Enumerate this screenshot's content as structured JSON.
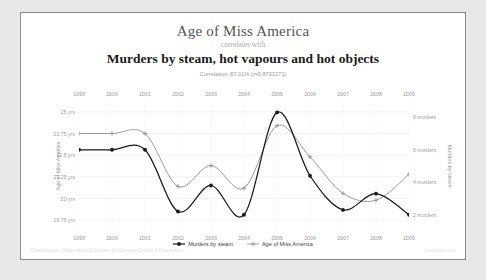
{
  "titles": {
    "main": "Age of Miss America",
    "connector": "correlates with",
    "subtitle": "Murders by steam, hot vapours and hot objects",
    "correlation": "Correlation: 87.01% (r=0.8701271)"
  },
  "footer": {
    "source": "Data sources: Wikipedia and Centers for Disease Control & Prevention",
    "watermark": "tylervigen.com"
  },
  "legend": {
    "items": [
      {
        "label": "Murders by steam",
        "color": "#1a1a1a",
        "marker": "filled-diamond"
      },
      {
        "label": "Age of Miss America",
        "color": "#8a8a8a",
        "marker": "open-plus"
      }
    ]
  },
  "chart_data": {
    "type": "line",
    "title": "Age of Miss America correlates with Murders by steam, hot vapours and hot objects",
    "xlabel": "",
    "x": [
      "1999",
      "2000",
      "2001",
      "2002",
      "2003",
      "2004",
      "2005",
      "2006",
      "2007",
      "2008",
      "2009"
    ],
    "grid": true,
    "legend_position": "bottom",
    "series": [
      {
        "name": "Murders by steam",
        "ylabel": "Murders by steam",
        "axis": "right",
        "ylim": [
          1.0,
          9.0
        ],
        "yticks": [
          8,
          6,
          4,
          2
        ],
        "ytick_labels": [
          "8 murders",
          "6 murders",
          "4 murders",
          "2 murders"
        ],
        "values": [
          6.0,
          6.0,
          6.0,
          2.2,
          3.8,
          2.0,
          8.3,
          4.4,
          2.3,
          3.3,
          2.0
        ],
        "color": "#1a1a1a"
      },
      {
        "name": "Age of Miss America",
        "ylabel": "Age of Miss America",
        "axis": "left",
        "ylim": [
          18.125,
          25.625
        ],
        "yticks": [
          25,
          23.75,
          22.5,
          21.25,
          20,
          18.75
        ],
        "ytick_labels": [
          "25 yrs",
          "23.75 yrs",
          "22.5 yrs",
          "21.25 yrs",
          "20 yrs",
          "18.75 yrs"
        ],
        "values": [
          23.75,
          23.75,
          23.75,
          20.7,
          21.9,
          20.6,
          24.2,
          22.4,
          20.3,
          19.9,
          21.4
        ],
        "color": "#8a8a8a"
      }
    ]
  }
}
